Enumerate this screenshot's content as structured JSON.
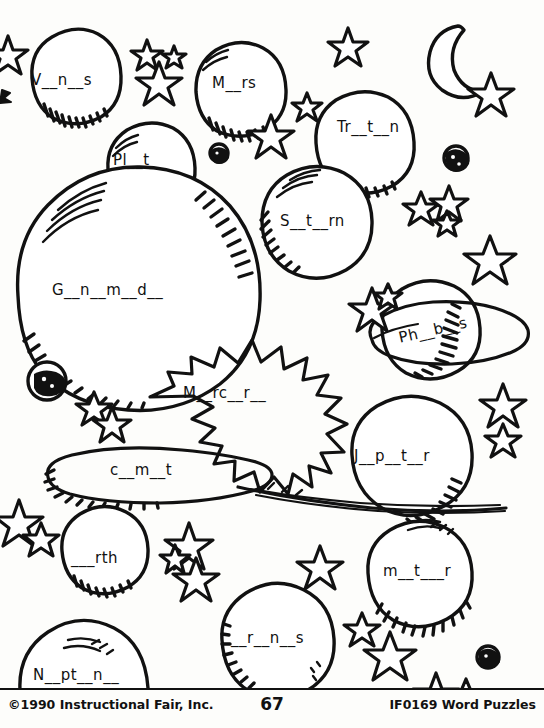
{
  "worksheet": {
    "title": "Space Word Puzzle Coloring Page",
    "theme": "solar system",
    "ink_color": "#111111",
    "paper_color": "#fdfdfb"
  },
  "puzzle_items": [
    {
      "id": "venus",
      "text": "V__n__s",
      "answer": "Venus",
      "shape": "planet"
    },
    {
      "id": "mars",
      "text": "M__rs",
      "answer": "Mars",
      "shape": "planet"
    },
    {
      "id": "pluto",
      "text": "Pl__t__",
      "answer": "Pluto",
      "shape": "planet"
    },
    {
      "id": "triton",
      "text": "Tr__t__n",
      "answer": "Triton",
      "shape": "planet"
    },
    {
      "id": "saturn",
      "text": "S__t__rn",
      "answer": "Saturn",
      "shape": "planet"
    },
    {
      "id": "ganymede",
      "text": "G__n__m__d__",
      "answer": "Ganymede",
      "shape": "planet"
    },
    {
      "id": "phobos",
      "text": "Ph__b__s",
      "answer": "Phobos",
      "shape": "ringed-planet"
    },
    {
      "id": "mercury",
      "text": "M__rc__r__",
      "answer": "Mercury",
      "shape": "sun"
    },
    {
      "id": "jupiter",
      "text": "J__p__t__r",
      "answer": "Jupiter",
      "shape": "planet"
    },
    {
      "id": "comet",
      "text": "c__m__t",
      "answer": "comet",
      "shape": "comet"
    },
    {
      "id": "earth",
      "text": "___rth",
      "answer": "Earth",
      "shape": "planet"
    },
    {
      "id": "meteor",
      "text": "m__t___r",
      "answer": "meteor",
      "shape": "planet"
    },
    {
      "id": "neptune",
      "text": "N__pt__n__",
      "answer": "Neptune",
      "shape": "planet"
    },
    {
      "id": "uranus",
      "text": "__r__n__s",
      "answer": "Uranus",
      "shape": "planet"
    }
  ],
  "decorations": {
    "crescent_moon": 1,
    "stars": 31,
    "small_moons": 4
  },
  "footer": {
    "copyright": "©1990 Instructional Fair, Inc.",
    "page_number": "67",
    "product_code": "IF0169 Word Puzzles"
  }
}
